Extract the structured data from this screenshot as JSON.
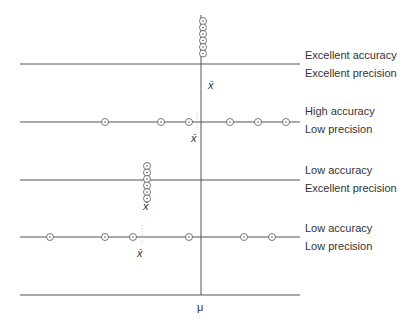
{
  "diagram": {
    "mu_label": "μ",
    "xbar_label": "x̄",
    "rows": [
      {
        "id": "excellent-accuracy-excellent-precision",
        "accuracy": "Excellent accuracy",
        "precision": "Excellent precision",
        "line_y": 64,
        "cluster": {
          "x": 203,
          "y_top": 21,
          "count": 6
        },
        "xbar": {
          "x": 213,
          "y": 87
        }
      },
      {
        "id": "high-accuracy-low-precision",
        "accuracy": "High accuracy",
        "precision": "Low precision",
        "line_y": 122,
        "points_x": [
          105,
          161,
          189,
          230,
          258,
          286
        ],
        "xbar": {
          "x": 196,
          "y": 140
        }
      },
      {
        "id": "low-accuracy-excellent-precision",
        "accuracy": "Low accuracy",
        "precision": "Excellent precision",
        "line_y": 180,
        "cluster": {
          "x": 147,
          "y_top": 166,
          "count": 6
        },
        "xbar": {
          "x": 147,
          "y": 208
        }
      },
      {
        "id": "low-accuracy-low-precision",
        "accuracy": "Low accuracy",
        "precision": "Low precision",
        "line_y": 237,
        "points_x": [
          50,
          105,
          133,
          189,
          244,
          272
        ],
        "xbar": {
          "x": 142,
          "y": 255
        }
      }
    ]
  }
}
